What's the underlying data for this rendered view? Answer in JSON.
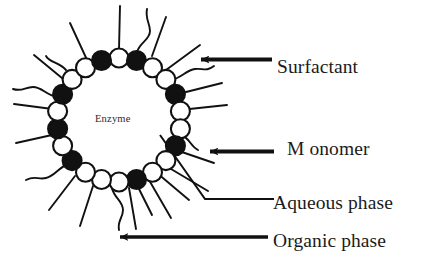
{
  "figure": {
    "kind": "reverse-micelle-schematic",
    "background_color": "#ffffff",
    "ink_color": "#111111",
    "width": 436,
    "height": 269
  },
  "inner_label": {
    "enzyme": "Enzyme"
  },
  "labels": {
    "surfactant": "Surfactant",
    "monomer": "M onomer",
    "aqueous_phase": "Aqueous phase",
    "organic_phase": "Organic phase"
  },
  "annotations": [
    {
      "name": "surfactant",
      "text": "Surfactant",
      "pointer": "arrow-left",
      "target": "open-circle-head-on-ring"
    },
    {
      "name": "monomer",
      "text": "M onomer",
      "pointer": "arrow-left",
      "target": "filled-circle-head-on-ring"
    },
    {
      "name": "aqueous-phase",
      "text": "Aqueous phase",
      "pointer": "leader-line",
      "target": "micelle-interior"
    },
    {
      "name": "organic-phase",
      "text": "Organic phase",
      "pointer": "arrow-left-long",
      "target": "region-outside-micelle"
    }
  ],
  "micelle": {
    "center_x": 119,
    "center_y": 120,
    "ring_radius": 62,
    "head_radius": 9.5,
    "head_count": 22,
    "filled_head_color": "#111111",
    "open_head_color": "#ffffff",
    "heads": [
      {
        "angle_deg": -90,
        "type": "open"
      },
      {
        "angle_deg": -73.6,
        "type": "filled"
      },
      {
        "angle_deg": -57.3,
        "type": "open"
      },
      {
        "angle_deg": -40.9,
        "type": "open"
      },
      {
        "angle_deg": -24.5,
        "type": "filled"
      },
      {
        "angle_deg": -8.2,
        "type": "open"
      },
      {
        "angle_deg": 8.2,
        "type": "open"
      },
      {
        "angle_deg": 24.5,
        "type": "filled"
      },
      {
        "angle_deg": 40.9,
        "type": "open"
      },
      {
        "angle_deg": 57.3,
        "type": "open"
      },
      {
        "angle_deg": 73.6,
        "type": "filled"
      },
      {
        "angle_deg": 90,
        "type": "open"
      },
      {
        "angle_deg": 106.4,
        "type": "open"
      },
      {
        "angle_deg": 122.7,
        "type": "open"
      },
      {
        "angle_deg": 139.1,
        "type": "filled"
      },
      {
        "angle_deg": 155.5,
        "type": "open"
      },
      {
        "angle_deg": 171.8,
        "type": "filled"
      },
      {
        "angle_deg": 188.2,
        "type": "open"
      },
      {
        "angle_deg": 204.5,
        "type": "filled"
      },
      {
        "angle_deg": 220.9,
        "type": "open"
      },
      {
        "angle_deg": 237.3,
        "type": "open"
      },
      {
        "angle_deg": 253.6,
        "type": "filled"
      }
    ]
  }
}
